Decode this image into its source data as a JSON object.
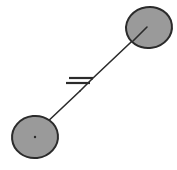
{
  "figure": {
    "type": "schematic-diagram",
    "width": 177,
    "height": 170,
    "background_color": "#ffffff",
    "title": "",
    "caption": ""
  },
  "style": {
    "node_fill_color": "#9a9a9a",
    "node_stroke_color": "#2b2b2b",
    "node_stroke_width": 2,
    "connector_color": "#2b2b2b",
    "connector_width": 1.6,
    "break_mark_color": "#2b2b2b",
    "break_mark_width": 2.2,
    "center_marker_color": "#2b2b2b"
  },
  "nodes": [
    {
      "id": "node-top-right",
      "label": "",
      "cx": 149,
      "cy": 27.5,
      "rx": 23,
      "ry": 20.5,
      "rotation": -8,
      "has_center_marker": true,
      "center_marker_kind": "radius-line"
    },
    {
      "id": "node-bottom-left",
      "label": "",
      "cx": 35,
      "cy": 137,
      "rx": 23,
      "ry": 21,
      "rotation": -6,
      "has_center_marker": true,
      "center_marker_kind": "dot"
    }
  ],
  "connector": {
    "id": "connector-line",
    "label": "",
    "from": "node-bottom-left",
    "to": "node-top-right",
    "x1": 44,
    "y1": 125,
    "x2": 147,
    "y2": 27,
    "segments": [
      {
        "x1": 44,
        "y1": 125,
        "x2": 80,
        "y2": 91
      },
      {
        "x1": 80,
        "y1": 91,
        "x2": 92,
        "y2": 79
      },
      {
        "x1": 92,
        "y1": 79,
        "x2": 147,
        "y2": 27
      }
    ]
  },
  "break_symbol": {
    "id": "break-mark",
    "kind": "double-slash-break",
    "label": "",
    "lines": [
      {
        "x1": 69,
        "y1": 78,
        "x2": 93,
        "y2": 78
      },
      {
        "x1": 66,
        "y1": 83,
        "x2": 90,
        "y2": 83
      }
    ]
  },
  "annotations": []
}
